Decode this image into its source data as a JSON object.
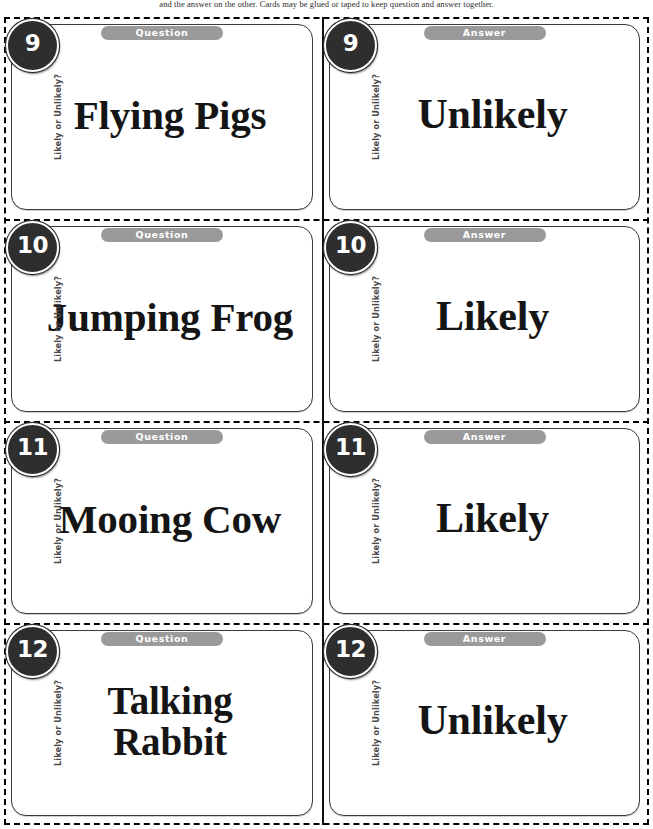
{
  "page": {
    "note": "and the answer on the other. Cards may be glued or taped to keep question and answer together."
  },
  "labels": {
    "question_pill": "Question",
    "answer_pill": "Answer",
    "side_label": "Likely or Unlikely?"
  },
  "colors": {
    "badge_fill": "#2e2e2e",
    "badge_text": "#ffffff",
    "pill_fill": "#9a9a9a",
    "pill_text": "#ffffff",
    "card_border": "#3a3a3a",
    "cut_line": "#000000",
    "card_text": "#151515"
  },
  "cards": [
    {
      "number": "9",
      "question": {
        "pill": "Question",
        "text": "Flying Pigs",
        "side_label": "Likely or Unlikely?"
      },
      "answer": {
        "pill": "Answer",
        "text": "Unlikely",
        "side_label": "Likely or Unlikely?"
      }
    },
    {
      "number": "10",
      "question": {
        "pill": "Question",
        "text": "Jumping Frog",
        "side_label": "Likely or Unlikely?"
      },
      "answer": {
        "pill": "Answer",
        "text": "Likely",
        "side_label": "Likely or Unlikely?"
      }
    },
    {
      "number": "11",
      "question": {
        "pill": "Question",
        "text": "Mooing Cow",
        "side_label": "Likely or Unlikely?"
      },
      "answer": {
        "pill": "Answer",
        "text": "Likely",
        "side_label": "Likely or Unlikely?"
      }
    },
    {
      "number": "12",
      "question": {
        "pill": "Question",
        "text": "Talking\nRabbit",
        "side_label": "Likely or Unlikely?"
      },
      "answer": {
        "pill": "Answer",
        "text": "Unlikely",
        "side_label": "Likely or Unlikely?"
      }
    }
  ]
}
